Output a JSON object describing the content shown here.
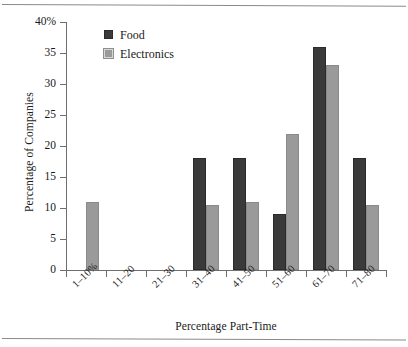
{
  "chart_data": {
    "type": "bar",
    "title": "",
    "xlabel": "Percentage Part-Time",
    "ylabel": "Percentage of Companies",
    "categories": [
      "1–10%",
      "11–20",
      "21–30",
      "31–40",
      "41–50",
      "51–60",
      "61–70",
      "71–80"
    ],
    "series": [
      {
        "name": "Food",
        "color": "#3a3a3a",
        "values": [
          0,
          0,
          0,
          18,
          18,
          9,
          36,
          18
        ]
      },
      {
        "name": "Electronics",
        "color": "#9a9a9a",
        "values": [
          11,
          0,
          0,
          10.5,
          11,
          22,
          33,
          10.5
        ]
      }
    ],
    "ylim": [
      0,
      40
    ],
    "ytick_values": [
      0,
      5,
      10,
      15,
      20,
      25,
      30,
      35,
      40
    ],
    "ytick_labels": [
      "0",
      "5",
      "10",
      "15",
      "20",
      "25",
      "30",
      "35",
      "40%"
    ],
    "grid": false,
    "legend_position": "top-left-inside"
  },
  "legend": {
    "items": [
      {
        "label": "Food",
        "swatch": "food"
      },
      {
        "label": "Electronics",
        "swatch": "electronics"
      }
    ]
  }
}
